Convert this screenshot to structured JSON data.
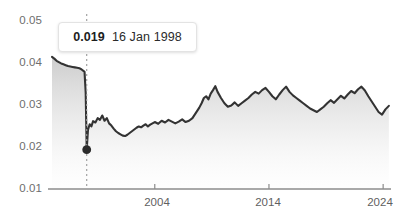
{
  "tooltip": {
    "value": "0.019",
    "date": "16 Jan 1998"
  },
  "colors": {
    "line": "#333333",
    "axis": "#888888",
    "tick_text": "#6e6e6e",
    "marker": "#2b2b2b",
    "crosshair": "#9a9a9a",
    "area_top": "#c9c9c9",
    "area_bottom": "#f7f7f7",
    "background": "#ffffff"
  },
  "chart_data": {
    "type": "area",
    "title": "",
    "xlabel": "",
    "ylabel": "",
    "grid": false,
    "legend": null,
    "xlim": [
      1995.0,
      2024.6
    ],
    "ylim": [
      0.01,
      0.05
    ],
    "y_ticks": [
      "0.05",
      "0.04",
      "0.03",
      "0.02",
      "0.01"
    ],
    "y_tick_values": [
      0.05,
      0.04,
      0.03,
      0.02,
      0.01
    ],
    "x_ticks": [
      "2004",
      "2014",
      "2024"
    ],
    "x_tick_values": [
      2004,
      2014,
      2024
    ],
    "annotation": {
      "label": "0.019  16 Jan 1998",
      "x": 1998.04,
      "y": 0.019,
      "marker": true,
      "crosshair": true
    },
    "series": [
      {
        "name": "rate",
        "x": [
          1995.0,
          1995.2,
          1995.4,
          1995.6,
          1995.8,
          1996.0,
          1996.2,
          1996.4,
          1996.6,
          1996.8,
          1997.0,
          1997.2,
          1997.4,
          1997.55,
          1997.65,
          1997.75,
          1997.85,
          1997.95,
          1998.04,
          1998.15,
          1998.3,
          1998.45,
          1998.6,
          1998.8,
          1999.0,
          1999.2,
          1999.4,
          1999.6,
          1999.8,
          2000.0,
          2000.2,
          2000.4,
          2000.6,
          2000.8,
          2001.0,
          2001.2,
          2001.4,
          2001.6,
          2001.8,
          2002.0,
          2002.2,
          2002.4,
          2002.6,
          2002.8,
          2003.0,
          2003.2,
          2003.4,
          2003.6,
          2003.8,
          2004.0,
          2004.3,
          2004.6,
          2004.9,
          2005.2,
          2005.5,
          2005.8,
          2006.1,
          2006.4,
          2006.7,
          2007.0,
          2007.3,
          2007.6,
          2007.9,
          2008.1,
          2008.3,
          2008.5,
          2008.7,
          2008.9,
          2009.1,
          2009.3,
          2009.5,
          2009.8,
          2010.1,
          2010.4,
          2010.7,
          2011.0,
          2011.3,
          2011.6,
          2011.9,
          2012.2,
          2012.5,
          2012.8,
          2013.1,
          2013.4,
          2013.7,
          2014.0,
          2014.3,
          2014.6,
          2014.9,
          2015.2,
          2015.5,
          2015.8,
          2016.1,
          2016.4,
          2016.7,
          2017.0,
          2017.3,
          2017.6,
          2017.9,
          2018.2,
          2018.5,
          2018.8,
          2019.1,
          2019.4,
          2019.7,
          2020.0,
          2020.3,
          2020.6,
          2020.9,
          2021.2,
          2021.5,
          2021.8,
          2022.1,
          2022.4,
          2022.7,
          2023.0,
          2023.3,
          2023.6,
          2023.9,
          2024.2,
          2024.5
        ],
        "y": [
          0.0402,
          0.0398,
          0.0393,
          0.039,
          0.0387,
          0.0385,
          0.0383,
          0.0381,
          0.038,
          0.0379,
          0.0378,
          0.0377,
          0.0376,
          0.0374,
          0.0372,
          0.037,
          0.0368,
          0.032,
          0.019,
          0.0235,
          0.0248,
          0.0243,
          0.0255,
          0.0252,
          0.0262,
          0.0258,
          0.0268,
          0.0256,
          0.0262,
          0.025,
          0.0245,
          0.0238,
          0.0232,
          0.0228,
          0.0225,
          0.0222,
          0.0221,
          0.0224,
          0.0228,
          0.0232,
          0.0236,
          0.024,
          0.0243,
          0.0241,
          0.0245,
          0.0248,
          0.0243,
          0.0247,
          0.025,
          0.0253,
          0.0249,
          0.0256,
          0.0252,
          0.0258,
          0.0254,
          0.025,
          0.0254,
          0.0259,
          0.0253,
          0.0256,
          0.0262,
          0.0274,
          0.0286,
          0.0296,
          0.0308,
          0.0312,
          0.0305,
          0.0318,
          0.0326,
          0.0335,
          0.0322,
          0.0308,
          0.0296,
          0.0288,
          0.0291,
          0.0298,
          0.029,
          0.0296,
          0.0302,
          0.0308,
          0.0316,
          0.0322,
          0.0318,
          0.0326,
          0.0331,
          0.0322,
          0.0312,
          0.0305,
          0.0316,
          0.0326,
          0.0334,
          0.0322,
          0.0314,
          0.0308,
          0.0302,
          0.0296,
          0.029,
          0.0284,
          0.028,
          0.0276,
          0.0282,
          0.0288,
          0.0296,
          0.0303,
          0.0297,
          0.0305,
          0.0313,
          0.0307,
          0.0316,
          0.0324,
          0.0319,
          0.0328,
          0.0334,
          0.0325,
          0.0312,
          0.03,
          0.0288,
          0.0276,
          0.027,
          0.0282,
          0.029
        ]
      }
    ]
  }
}
